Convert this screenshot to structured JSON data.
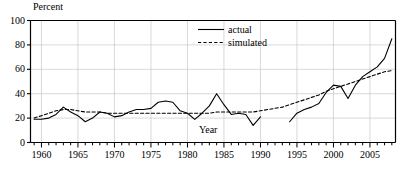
{
  "chart_data": {
    "type": "line",
    "title": "",
    "ylabel": "Percent",
    "xlabel": "Year",
    "xlim": [
      1958.5,
      2008.5
    ],
    "ylim": [
      0,
      100
    ],
    "grid": true,
    "legend_position": "top-center",
    "y_ticks": [
      0,
      20,
      40,
      60,
      80,
      100
    ],
    "y_tick_labels": [
      "0",
      "20",
      "40",
      "60",
      "80",
      "100"
    ],
    "x_ticks": [
      1960,
      1965,
      1970,
      1975,
      1980,
      1985,
      1990,
      1995,
      2000,
      2005
    ],
    "x_tick_labels": [
      "1960",
      "1965",
      "1970",
      "1975",
      "1980",
      "1985",
      "1990",
      "1995",
      "2000",
      "2005"
    ],
    "x_minor_tick_interval": 1,
    "series": [
      {
        "name": "actual",
        "style": "solid",
        "color": "#000000",
        "x": [
          1959,
          1960,
          1961,
          1962,
          1963,
          1964,
          1965,
          1966,
          1967,
          1968,
          1969,
          1970,
          1971,
          1972,
          1973,
          1974,
          1975,
          1976,
          1977,
          1978,
          1979,
          1980,
          1981,
          1982,
          1983,
          1984,
          1985,
          1986,
          1987,
          1988,
          1989,
          1990
        ],
        "y": [
          19,
          19,
          20,
          23,
          29,
          25,
          22,
          17,
          20,
          25,
          24,
          21,
          22,
          25,
          27,
          27,
          28,
          33,
          34,
          33,
          26,
          24,
          19,
          24,
          30,
          40,
          31,
          23,
          24,
          23,
          14,
          21
        ]
      },
      {
        "name": "actual",
        "style": "solid",
        "color": "#000000",
        "x": [
          1994,
          1995,
          1996,
          1997,
          1998,
          1999,
          2000,
          2001,
          2002,
          2003,
          2004,
          2005,
          2006,
          2007,
          2008
        ],
        "y": [
          17,
          24,
          27,
          29,
          32,
          41,
          47,
          46,
          36,
          47,
          54,
          58,
          62,
          69,
          85
        ]
      },
      {
        "name": "simulated",
        "style": "dashed",
        "color": "#000000",
        "x": [
          1959,
          1960,
          1961,
          1962,
          1963,
          1964,
          1965,
          1966,
          1967,
          1968,
          1969,
          1970,
          1971,
          1972,
          1973,
          1974,
          1975,
          1976,
          1977,
          1978,
          1979,
          1980,
          1981,
          1982,
          1983,
          1984,
          1985,
          1986,
          1987,
          1988,
          1989,
          1990,
          1991,
          1992,
          1993,
          1994,
          1995,
          1996,
          1997,
          1998,
          1999,
          2000,
          2001,
          2002,
          2003,
          2004,
          2005,
          2006,
          2007,
          2008
        ],
        "y": [
          20,
          22,
          24,
          26,
          27,
          27,
          26,
          25,
          25,
          25,
          24,
          24,
          24,
          24,
          24,
          24,
          24,
          24,
          24,
          24,
          24,
          24,
          24,
          24,
          24,
          25,
          25,
          25,
          25,
          25,
          25,
          26,
          27,
          28,
          29,
          31,
          33,
          35,
          37,
          39,
          42,
          44,
          46,
          48,
          50,
          52,
          54,
          56,
          58,
          59
        ]
      }
    ],
    "legend": [
      {
        "label": "actual",
        "style": "solid"
      },
      {
        "label": "simulated",
        "style": "dashed"
      }
    ]
  },
  "caption": ""
}
